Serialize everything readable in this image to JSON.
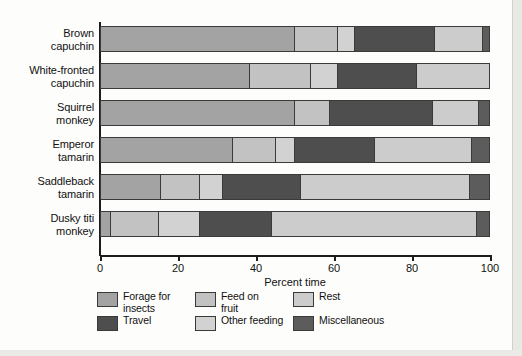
{
  "chart_data": {
    "type": "bar",
    "orientation": "horizontal",
    "stacked": true,
    "title": "",
    "xlabel": "Percent time",
    "ylabel": "",
    "xlim": [
      0,
      100
    ],
    "xticks": [
      0,
      20,
      40,
      60,
      80,
      100
    ],
    "xtick_labels": [
      "0",
      "20",
      "40",
      "60",
      "80",
      "100"
    ],
    "grid": false,
    "legend_position": "bottom",
    "categories": [
      "Brown capuchin",
      "White-fronted capuchin",
      "Squirrel monkey",
      "Emperor tamarin",
      "Saddleback tamarin",
      "Dusky titi monkey"
    ],
    "category_lines": [
      [
        "Brown",
        "capuchin"
      ],
      [
        "White-fronted",
        "capuchin"
      ],
      [
        "Squirrel",
        "monkey"
      ],
      [
        "Emperor",
        "tamarin"
      ],
      [
        "Saddleback",
        "tamarin"
      ],
      [
        "Dusky titi",
        "monkey"
      ]
    ],
    "series": [
      {
        "name": "Forage for insects",
        "color": "#a3a3a3",
        "values": [
          50,
          38.5,
          50,
          34,
          15.5,
          2.5
        ]
      },
      {
        "name": "Feed on fruit",
        "color": "#c2c2c2",
        "values": [
          11,
          15.5,
          9,
          11,
          10,
          12.5
        ]
      },
      {
        "name": "Other feeding",
        "color": "#d2d2d2",
        "values": [
          4.5,
          7,
          0,
          5,
          6,
          10.5
        ]
      },
      {
        "name": "Travel",
        "color": "#4e4e4e",
        "values": [
          20.5,
          20.5,
          26.5,
          20.5,
          20,
          18.5
        ]
      },
      {
        "name": "Rest",
        "color": "#cccccc",
        "values": [
          12.5,
          18.5,
          12,
          25,
          43.5,
          53
        ]
      },
      {
        "name": "Miscellaneous",
        "color": "#5c5c5c",
        "values": [
          1.5,
          0,
          2.5,
          4.5,
          5,
          3
        ]
      }
    ],
    "legend_entries": [
      {
        "name": "Forage for insects",
        "lines": [
          "Forage for",
          "insects"
        ],
        "color": "#a3a3a3"
      },
      {
        "name": "Feed on fruit",
        "lines": [
          "Feed on",
          "fruit"
        ],
        "color": "#c2c2c2"
      },
      {
        "name": "Rest",
        "lines": [
          "Rest"
        ],
        "color": "#cccccc"
      },
      {
        "name": "Travel",
        "lines": [
          "Travel"
        ],
        "color": "#4e4e4e"
      },
      {
        "name": "Other feeding",
        "lines": [
          "Other feeding"
        ],
        "color": "#d2d2d2"
      },
      {
        "name": "Miscellaneous",
        "lines": [
          "Miscellaneous"
        ],
        "color": "#5c5c5c"
      }
    ]
  }
}
